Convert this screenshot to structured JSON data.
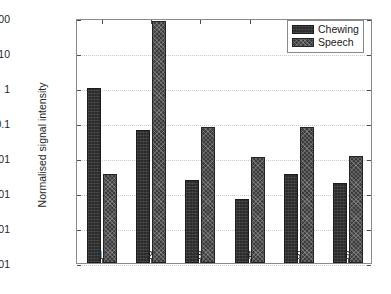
{
  "chart_data": {
    "type": "bar",
    "title": "",
    "xlabel": "",
    "ylabel": "Normalised signal intensity",
    "categories": [
      "1",
      "2",
      "3",
      "4",
      "5",
      "6"
    ],
    "yscale": "log",
    "ylim": [
      1e-05,
      100
    ],
    "ytick_labels": [
      "100",
      "10",
      "1",
      "0.1",
      "0.01",
      "0.001",
      "0.0001",
      "0.00001"
    ],
    "ytick_values": [
      100,
      10,
      1,
      0.1,
      0.01,
      0.001,
      0.0001,
      1e-05
    ],
    "grid": true,
    "legend_position": "top-right",
    "series": [
      {
        "name": "Chewing",
        "color": "#2b2b2b",
        "values": [
          1.0,
          0.063,
          0.0024,
          0.00068,
          0.0034,
          0.0019
        ]
      },
      {
        "name": "Speech",
        "color": "#3c3c3c",
        "values": [
          0.0036,
          80,
          0.077,
          0.0104,
          0.077,
          0.0115
        ]
      }
    ]
  },
  "legend": {
    "items": [
      {
        "label": "Chewing",
        "swatch": "chewing-swatch"
      },
      {
        "label": "Speech",
        "swatch": "speech-swatch"
      }
    ]
  }
}
